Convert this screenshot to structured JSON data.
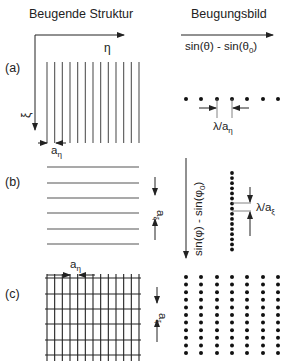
{
  "headers": {
    "left": "Beugende Struktur",
    "right": "Beugungsbild"
  },
  "panels": {
    "a": {
      "label": "(a)"
    },
    "b": {
      "label": "(b)"
    },
    "c": {
      "label": "(c)"
    }
  },
  "axes": {
    "eta": "η",
    "xi": "ξ",
    "theta_axis_main": "sin(θ) - sin(θ",
    "theta_axis_sub": "0",
    "theta_axis_close": ")",
    "phi_axis_main": "sin(φ) - sin(φ",
    "phi_axis_sub": "0",
    "phi_axis_close": ")"
  },
  "annotations": {
    "a_eta_base": "a",
    "a_eta_sub": "η",
    "a_xi_base": "a",
    "a_xi_sub": "ξ",
    "lambda_over_a_eta_base": "λ/a",
    "lambda_over_a_eta_sub": "η",
    "lambda_over_a_xi_base": "λ/a",
    "lambda_over_a_xi_sub": "ξ"
  },
  "structure": {
    "line_count_vertical": 13,
    "line_count_horizontal": 6,
    "x_start": 47,
    "x_end": 139,
    "line_color": "#555555"
  },
  "pattern": {
    "columns_x": [
      186,
      201,
      217,
      232,
      247,
      263,
      278
    ],
    "row_a_y": 99,
    "column_b_x": 232,
    "column_b_count": 16,
    "rows_c_count": 11,
    "dot_color": "#111111"
  }
}
